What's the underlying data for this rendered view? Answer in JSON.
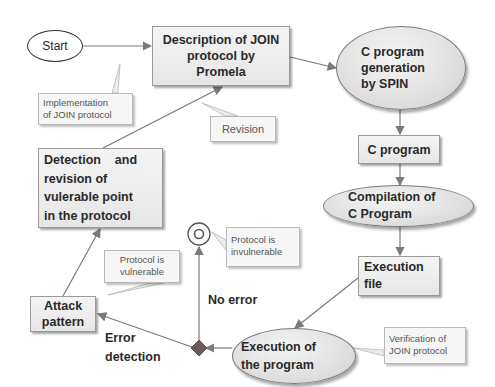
{
  "diagram": {
    "nodes": {
      "start": {
        "label": "Start"
      },
      "description": {
        "lines": [
          "Description of JOIN",
          "protocol by",
          "Promela"
        ]
      },
      "c_gen": {
        "lines": [
          "C program",
          "generation",
          "by SPIN"
        ]
      },
      "c_program": {
        "label": "C program"
      },
      "compilation": {
        "lines": [
          "Compilation of",
          "C Program"
        ]
      },
      "execution_file": {
        "lines": [
          "Execution",
          "file"
        ]
      },
      "execution_program": {
        "lines": [
          "Execution of",
          "the program"
        ]
      },
      "attack_pattern": {
        "lines": [
          "Attack",
          "pattern"
        ]
      },
      "detection": {
        "lines": [
          "Detection    and",
          "revision of",
          "vulerable point",
          "in the protocol"
        ]
      }
    },
    "callouts": {
      "implementation": {
        "lines": [
          "Implementation",
          "of JOIN protocol"
        ]
      },
      "revision": {
        "label": "Revision"
      },
      "invulnerable": {
        "lines": [
          "Protocol is",
          "invulnerable"
        ]
      },
      "vulnerable": {
        "lines": [
          "Protocol is",
          "vulnerable"
        ]
      },
      "verification": {
        "lines": [
          "Verification of",
          "JOIN protocol"
        ]
      }
    },
    "edge_labels": {
      "no_error": "No error",
      "error_detection": [
        "Error",
        "detection"
      ]
    },
    "colors": {
      "node_fill": "#e6e6e6",
      "node_border": "#9a9a9a",
      "arrow": "#7a7a7a",
      "decision_diamond": "#6b5a5a",
      "text": "#2a2a2a"
    }
  }
}
